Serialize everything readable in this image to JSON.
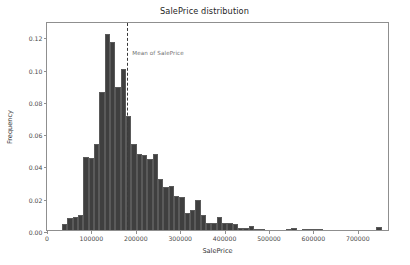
{
  "chart_data": {
    "type": "bar",
    "title": "SalePrice distribution",
    "xlabel": "SalePrice",
    "ylabel": "Frequency",
    "xlim": [
      0,
      772500
    ],
    "ylim": [
      0,
      0.1295
    ],
    "grid": false,
    "legend": null,
    "bar_color": "#3f3f3f",
    "bar_edge_color": "#5a5a5a",
    "bin_width": 12000,
    "bin_start": 34000,
    "xticks": [
      0,
      100000,
      200000,
      300000,
      400000,
      500000,
      600000,
      700000
    ],
    "xtick_labels": [
      "0",
      "100000",
      "200000",
      "300000",
      "400000",
      "500000",
      "600000",
      "700000"
    ],
    "yticks": [
      0.0,
      0.02,
      0.04,
      0.06,
      0.08,
      0.1,
      0.12
    ],
    "ytick_labels": [
      "0.00",
      "0.02",
      "0.04",
      "0.06",
      "0.08",
      "0.10",
      "0.12"
    ],
    "bin_centers": [
      40000,
      52000,
      64000,
      76000,
      88000,
      100000,
      112000,
      124000,
      136000,
      148000,
      160000,
      172000,
      184000,
      196000,
      208000,
      220000,
      232000,
      244000,
      256000,
      268000,
      280000,
      292000,
      304000,
      316000,
      328000,
      340000,
      352000,
      364000,
      376000,
      388000,
      400000,
      412000,
      424000,
      436000,
      448000,
      460000,
      472000,
      484000,
      496000,
      508000,
      520000,
      532000,
      544000,
      556000,
      568000,
      580000,
      592000,
      604000,
      616000,
      628000,
      640000,
      652000,
      664000,
      676000,
      688000,
      700000,
      712000,
      724000,
      736000,
      748000
    ],
    "values": [
      0.0035,
      0.0075,
      0.0082,
      0.0092,
      0.0455,
      0.0448,
      0.0533,
      0.0855,
      0.1215,
      0.1168,
      0.0888,
      0.0995,
      0.0708,
      0.0535,
      0.0468,
      0.0465,
      0.0443,
      0.0468,
      0.0318,
      0.0268,
      0.0272,
      0.0208,
      0.0205,
      0.0105,
      0.0122,
      0.0188,
      0.0095,
      0.0042,
      0.0045,
      0.0078,
      0.0045,
      0.0042,
      0.0038,
      0.0015,
      0.0015,
      0.0022,
      0.0008,
      0.0002,
      0.0,
      0.0,
      0.0,
      0.0,
      0.0008,
      0.0015,
      0.0,
      0.0005,
      0.0005,
      0.0005,
      0.0008,
      0.0,
      0.0,
      0.0,
      0.0,
      0.0,
      0.0,
      0.0,
      0.0,
      0.0,
      0.0,
      0.0018
    ],
    "annotations": [
      {
        "name": "mean-line",
        "label": "Mean of SalePrice",
        "x": 180921,
        "style": "dashed-vertical",
        "color": "#3a3a3a",
        "label_color": "#6e6e6e"
      }
    ]
  }
}
